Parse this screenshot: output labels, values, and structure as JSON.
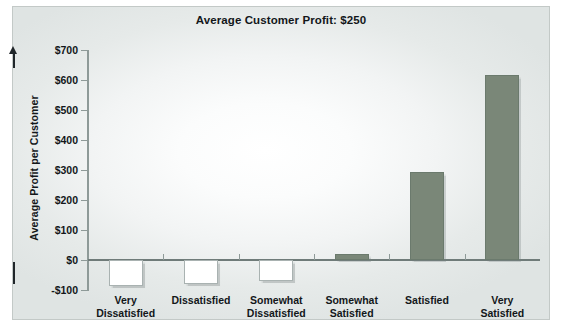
{
  "chart_data": {
    "type": "bar",
    "title": "Average Customer Profit: $250",
    "xlabel": "",
    "ylabel": "Average Profit per Customer",
    "categories": [
      "Very Dissatisfied",
      "Dissatisfied",
      "Somewhat Dissatisfied",
      "Somewhat Satisfied",
      "Satisfied",
      "Very Satisfied"
    ],
    "category_lines": [
      [
        "Very",
        "Dissatisfied"
      ],
      [
        "Dissatisfied",
        ""
      ],
      [
        "Somewhat",
        "Dissatisfied"
      ],
      [
        "Somewhat",
        "Satisfied"
      ],
      [
        "Satisfied",
        ""
      ],
      [
        "Very",
        "Satisfied"
      ]
    ],
    "values": [
      -85,
      -80,
      -70,
      20,
      295,
      618
    ],
    "ylim": [
      -100,
      700
    ],
    "ytick_values": [
      700,
      600,
      500,
      400,
      300,
      200,
      100,
      0,
      -100
    ],
    "ytick_labels": [
      "$700",
      "$600",
      "$500",
      "$400",
      "$300",
      "$200",
      "$100",
      "$0",
      "-$100"
    ],
    "grid": false,
    "legend": "none",
    "colors": {
      "positive_bar": "#7a8778",
      "negative_bar": "#ffffff",
      "bar_outline": "#6b7a6d",
      "axis": "#8e9a98",
      "text": "#13171a",
      "frame": "#c3c9c7",
      "plot_background": "#f2f4f4"
    }
  }
}
